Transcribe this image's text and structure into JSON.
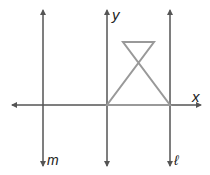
{
  "diagram": {
    "labels": {
      "y_axis": "y",
      "x_axis": "x",
      "line_m": "m",
      "line_l": "ℓ"
    },
    "colors": {
      "axes": "#555555",
      "figure": "#999999"
    },
    "figure": {
      "shape": "hourglass",
      "vertices": [
        [
          107,
          105
        ],
        [
          170,
          105
        ],
        [
          123,
          42
        ],
        [
          154,
          42
        ]
      ]
    }
  }
}
